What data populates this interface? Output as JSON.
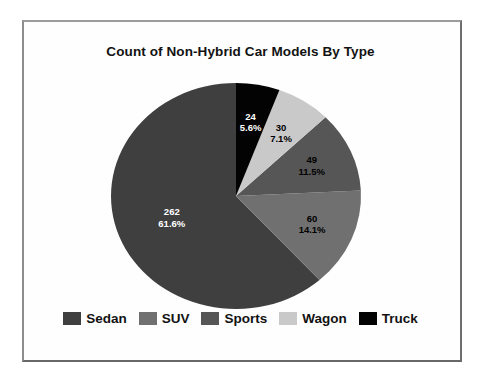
{
  "chart_data": {
    "type": "pie",
    "title": "Count of Non-Hybrid Car Models By Type",
    "categories": [
      "Sedan",
      "SUV",
      "Sports",
      "Wagon",
      "Truck"
    ],
    "values": [
      262,
      60,
      49,
      30,
      24
    ],
    "percent_labels": [
      "61.6%",
      "14.1%",
      "11.5%",
      "7.1%",
      "5.6%"
    ],
    "legend_position": "bottom",
    "start_angle": "12 o'clock",
    "direction": "counterclockwise",
    "slices": [
      {
        "label": "Sedan",
        "value": 262,
        "pct_label": "61.6%",
        "color": "#3f3f3f",
        "text_color": "#ffffff"
      },
      {
        "label": "SUV",
        "value": 60,
        "pct_label": "14.1%",
        "color": "#707070",
        "text_color": "#000000"
      },
      {
        "label": "Sports",
        "value": 49,
        "pct_label": "11.5%",
        "color": "#565656",
        "text_color": "#000000"
      },
      {
        "label": "Wagon",
        "value": 30,
        "pct_label": "7.1%",
        "color": "#c9c9c9",
        "text_color": "#000000"
      },
      {
        "label": "Truck",
        "value": 24,
        "pct_label": "5.6%",
        "color": "#030303",
        "text_color": "#ffffff"
      }
    ]
  }
}
